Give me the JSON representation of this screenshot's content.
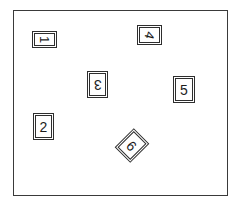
{
  "scene": {
    "title": "Numbered boxes scattered inside a bounding frame",
    "frame": {
      "name": "scene-frame",
      "stroke_color": "#3a3a3a",
      "fill_color": "#ffffff",
      "x": 13,
      "y": 10,
      "width": 215,
      "height": 186
    },
    "background_color": "#ffffff",
    "box_stroke_color": "#2e2e2e",
    "box_fill_color": "#ffffff",
    "digit_color": "#1c1c1c",
    "boxes": [
      {
        "label": "1",
        "name": "numbered-box-1",
        "x": 32,
        "y": 31,
        "width": 25,
        "height": 17,
        "box_rotation_deg": 0,
        "digit_rotation_deg": 90,
        "digit_font_size": 13,
        "orientation": "landscape"
      },
      {
        "label": "4",
        "name": "numbered-box-4",
        "x": 137,
        "y": 25,
        "width": 25,
        "height": 20,
        "box_rotation_deg": 0,
        "digit_rotation_deg": 105,
        "digit_font_size": 13,
        "orientation": "landscape"
      },
      {
        "label": "3",
        "name": "numbered-box-3",
        "x": 87,
        "y": 71,
        "width": 21,
        "height": 27,
        "box_rotation_deg": 0,
        "digit_rotation_deg": 180,
        "digit_font_size": 14,
        "orientation": "portrait"
      },
      {
        "label": "5",
        "name": "numbered-box-5",
        "x": 173,
        "y": 76,
        "width": 22,
        "height": 27,
        "box_rotation_deg": 0,
        "digit_rotation_deg": 0,
        "digit_font_size": 14,
        "orientation": "portrait"
      },
      {
        "label": "2",
        "name": "numbered-box-2",
        "x": 33,
        "y": 113,
        "width": 21,
        "height": 27,
        "box_rotation_deg": 0,
        "digit_rotation_deg": 0,
        "digit_font_size": 14,
        "orientation": "portrait"
      },
      {
        "label": "6",
        "name": "numbered-box-6",
        "x": 121,
        "y": 132,
        "width": 22,
        "height": 27,
        "box_rotation_deg": 45,
        "digit_rotation_deg": 0,
        "digit_font_size": 14,
        "orientation": "diamond"
      }
    ]
  }
}
